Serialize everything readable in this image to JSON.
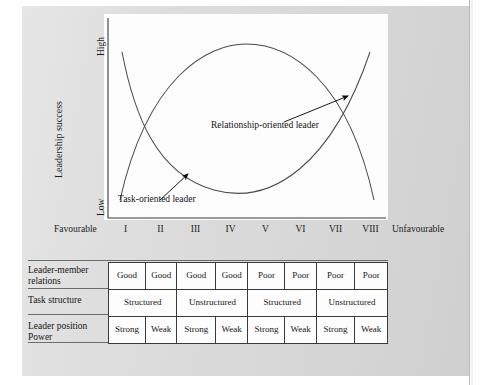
{
  "page": {
    "clipped_top_text": "",
    "background_color": "#dcdcdc",
    "ink_color": "#1c1c1c"
  },
  "chart_data": {
    "type": "line",
    "title": "",
    "xlabel": "",
    "ylabel": "Leadership success",
    "y_axis": {
      "high_label": "High",
      "low_label": "Low",
      "ylim": [
        0,
        100
      ]
    },
    "x_axis": {
      "favourable_label": "Favourable",
      "unfavourable_label": "Unfavourable",
      "categories": [
        "I",
        "II",
        "III",
        "IV",
        "V",
        "VI",
        "VII",
        "VIII"
      ]
    },
    "grid": false,
    "legend": "inline-annotations",
    "series": [
      {
        "name": "Task-oriented leader",
        "shape": "u-curve",
        "values": [
          96,
          58,
          30,
          16,
          14,
          26,
          52,
          92
        ],
        "annotation": "Task-oriented leader"
      },
      {
        "name": "Relationship-oriented leader",
        "shape": "inverted-u-curve",
        "values": [
          8,
          48,
          76,
          90,
          90,
          76,
          48,
          8
        ],
        "annotation": "Relationship-oriented leader"
      }
    ]
  },
  "table": {
    "row_labels": [
      "Leader-member relations",
      "Task structure",
      "Leader position Power"
    ],
    "rows": [
      {
        "label": "Leader-member relations",
        "cells": [
          {
            "text": "Good",
            "span": 1
          },
          {
            "text": "Good",
            "span": 1
          },
          {
            "text": "Good",
            "span": 1
          },
          {
            "text": "Good",
            "span": 1
          },
          {
            "text": "Poor",
            "span": 1
          },
          {
            "text": "Poor",
            "span": 1
          },
          {
            "text": "Poor",
            "span": 1
          },
          {
            "text": "Poor",
            "span": 1
          }
        ]
      },
      {
        "label": "Task structure",
        "cells": [
          {
            "text": "Structured",
            "span": 2
          },
          {
            "text": "Unstructured",
            "span": 2
          },
          {
            "text": "Structured",
            "span": 2
          },
          {
            "text": "Unstructured",
            "span": 2
          }
        ]
      },
      {
        "label": "Leader position Power",
        "cells": [
          {
            "text": "Strong",
            "span": 1
          },
          {
            "text": "Weak",
            "span": 1
          },
          {
            "text": "Strong",
            "span": 1
          },
          {
            "text": "Weak",
            "span": 1
          },
          {
            "text": "Strong",
            "span": 1
          },
          {
            "text": "Weak",
            "span": 1
          },
          {
            "text": "Strong",
            "span": 1
          },
          {
            "text": "Weak",
            "span": 1
          }
        ]
      }
    ]
  }
}
